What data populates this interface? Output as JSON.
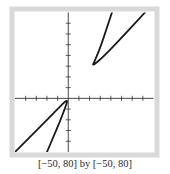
{
  "chart_data": {
    "type": "line",
    "title": "",
    "xlabel": "",
    "ylabel": "",
    "xlim": [
      -50,
      80
    ],
    "ylim": [
      -50,
      80
    ],
    "xscale": 10,
    "yscale": 10,
    "grid": false,
    "legend": null,
    "x_ticks": [
      -40,
      -30,
      -20,
      -10,
      10,
      20,
      30,
      40,
      50,
      60,
      70
    ],
    "y_ticks": [
      -40,
      -30,
      -20,
      -10,
      10,
      20,
      30,
      40,
      50,
      60,
      70
    ],
    "series": [
      {
        "name": "lower-branch",
        "points": [
          [
            -50,
            -50
          ],
          [
            -30,
            -30
          ],
          [
            -10,
            -10
          ],
          [
            0,
            0
          ],
          [
            -3,
            -9
          ],
          [
            -8,
            -22
          ],
          [
            -14,
            -36
          ],
          [
            -20,
            -50
          ]
        ]
      },
      {
        "name": "upper-branch",
        "points": [
          [
            41,
            80
          ],
          [
            36,
            65
          ],
          [
            31,
            50
          ],
          [
            27,
            40
          ],
          [
            24,
            33
          ],
          [
            23,
            31
          ],
          [
            25,
            32
          ],
          [
            32,
            38
          ],
          [
            44,
            50
          ],
          [
            57,
            64
          ],
          [
            72,
            80
          ]
        ]
      }
    ],
    "caption": "[−50, 80] by [−50, 80]"
  },
  "colors": {
    "frame": "#d9d9d9",
    "axes": "#333333",
    "curve": "#1a1a1a",
    "background": "#ffffff"
  }
}
